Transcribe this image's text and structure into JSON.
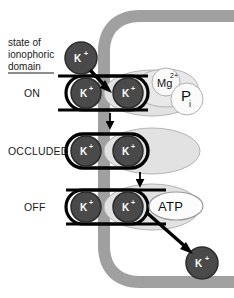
{
  "figure": {
    "caption": {
      "lines": [
        "state of",
        "ionophoric",
        "domain"
      ],
      "underlined_line": "domain"
    },
    "states": [
      {
        "id": "on",
        "label": "ON"
      },
      {
        "id": "occluded",
        "label": "OCCLUDED"
      },
      {
        "id": "off",
        "label": "OFF"
      }
    ],
    "ions": {
      "symbol": "K",
      "charge": "+",
      "free_top_label": "K",
      "free_bottom_label": "K"
    },
    "ligands": [
      {
        "id": "mg",
        "label": "Mg",
        "superscript": "2+"
      },
      {
        "id": "pi",
        "label": "P",
        "subscript": "i"
      },
      {
        "id": "atp",
        "label": "ATP"
      }
    ],
    "membrane": {
      "name": "membrane-band",
      "color": "#a0a0a0"
    },
    "colors": {
      "ion_fill": "#4a4a4a",
      "ion_stroke": "#2b2b2b",
      "protein_fill": "#e2e2e2",
      "protein_stroke": "#b4b4b4",
      "gate_stroke": "#000000",
      "membrane": "#a0a0a0",
      "ligand_fill": "#fafafa",
      "text": "#1a1a1a",
      "background": "#ffffff"
    },
    "counts": {
      "ions_per_site": 2,
      "states": 3
    }
  }
}
